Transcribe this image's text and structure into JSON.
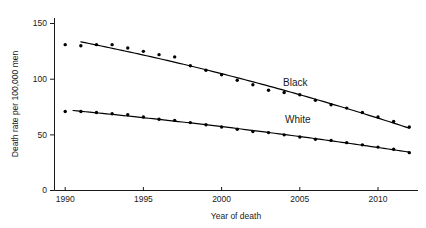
{
  "chart_data": {
    "type": "scatter",
    "title": "",
    "xlabel": "Year of death",
    "ylabel": "Death rate per 100,000 men",
    "xlim": [
      1989.5,
      2012.5
    ],
    "ylim": [
      0,
      155
    ],
    "xticks": [
      1990,
      1995,
      2000,
      2005,
      2010
    ],
    "yticks": [
      0,
      50,
      100,
      150
    ],
    "grid": false,
    "legend_position": "inline-annotation",
    "x": [
      1990,
      1991,
      1992,
      1993,
      1994,
      1995,
      1996,
      1997,
      1998,
      1999,
      2000,
      2001,
      2002,
      2003,
      2004,
      2005,
      2006,
      2007,
      2008,
      2009,
      2010,
      2011,
      2012
    ],
    "series": [
      {
        "name": "Black",
        "label": "Black",
        "values": [
          131,
          130,
          131,
          131,
          128,
          125,
          122,
          120,
          112,
          108,
          104,
          99,
          95,
          90,
          88,
          86,
          81,
          77,
          74,
          70,
          66,
          62,
          57
        ],
        "fit": {
          "type": "smooth-curve",
          "start": [
            1991.0,
            143.5
          ],
          "end": [
            2012.0,
            57.5
          ]
        }
      },
      {
        "name": "White",
        "label": "White",
        "values": [
          71,
          71,
          70,
          69,
          68,
          66,
          64,
          63,
          61,
          59,
          57,
          55,
          53,
          52,
          50,
          48,
          46,
          45,
          43,
          41,
          39,
          37,
          34
        ],
        "fit": {
          "type": "smooth-curve",
          "start": [
            1990.5,
            73.5
          ],
          "end": [
            2012.0,
            34.5
          ]
        }
      }
    ]
  }
}
